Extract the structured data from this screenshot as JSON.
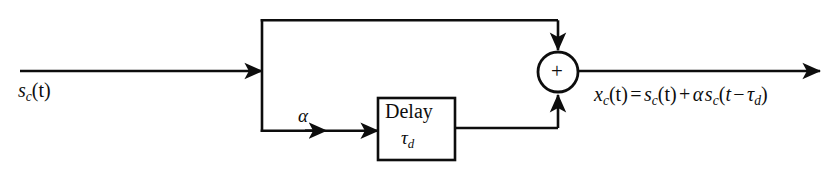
{
  "diagram": {
    "type": "signal-flow-block-diagram",
    "background_color": "#ffffff",
    "line_color": "#0d0d0d",
    "labels": {
      "input_signal": "s_c(t)",
      "input_signal_base": "s",
      "input_signal_sub": "c",
      "input_signal_arg": "(t)",
      "gain": "α",
      "delay_block_name": "Delay",
      "delay_block_param_base": "τ",
      "delay_block_param_sub": "d",
      "adder_sign": "+",
      "output_equation": "x_c(t) = s_c(t) + α s_c(t − τ_d)",
      "output_lhs_base": "x",
      "output_lhs_sub": "c",
      "output_lhs_arg": "(t)",
      "equals": "=",
      "term1_base": "s",
      "term1_sub": "c",
      "term1_arg": "(t)",
      "plus": "+",
      "term2_gain": "α",
      "term2_base": "s",
      "term2_sub": "c",
      "term2_open": "(t",
      "minus": "−",
      "term2_tau": "τ",
      "term2_tau_sub": "d",
      "term2_close": ")"
    },
    "nodes": [
      {
        "name": "input-port",
        "x": 20,
        "y": 71
      },
      {
        "name": "branch-node",
        "x": 262,
        "y": 71
      },
      {
        "name": "delay-block",
        "x": 378,
        "y": 98,
        "width": 77,
        "height": 62
      },
      {
        "name": "summing-junction",
        "cx": 558,
        "cy": 72,
        "r": 20
      },
      {
        "name": "output-port",
        "x": 820,
        "y": 71
      }
    ],
    "edges": [
      {
        "name": "input-to-branch",
        "from": "input-port",
        "to": "branch-node"
      },
      {
        "name": "direct-path",
        "from": "branch-node",
        "to": "summing-junction"
      },
      {
        "name": "branch-to-delay",
        "from": "branch-node",
        "to": "delay-block"
      },
      {
        "name": "delay-to-summing",
        "from": "delay-block",
        "to": "summing-junction"
      },
      {
        "name": "summing-to-output",
        "from": "summing-junction",
        "to": "output-port"
      }
    ]
  }
}
